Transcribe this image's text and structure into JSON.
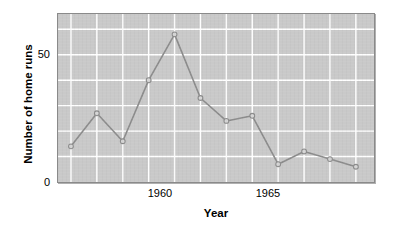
{
  "chart_data": {
    "type": "line",
    "title": "",
    "xlabel": "Year",
    "ylabel": "Number of home runs",
    "x": [
      1957,
      1958,
      1959,
      1960,
      1961,
      1962,
      1963,
      1964,
      1965,
      1966,
      1967,
      1968
    ],
    "values": [
      14,
      27,
      16,
      40,
      58,
      33,
      24,
      26,
      7,
      12,
      9,
      6
    ],
    "series": [
      {
        "name": "Number of home runs",
        "values": [
          14,
          27,
          16,
          40,
          58,
          33,
          24,
          26,
          7,
          12,
          9,
          6
        ]
      }
    ],
    "xlim": [
      1956.5,
      1968.7
    ],
    "ylim": [
      0,
      66
    ],
    "xticks": [
      1960,
      1965
    ],
    "xtick_labels": [
      "1960",
      "1965"
    ],
    "yticks": [
      0,
      50
    ],
    "ytick_labels": [
      "0",
      "50"
    ],
    "grid": true,
    "grid_color": "#ffffff",
    "plot_background": "#c9c9c9",
    "line_color": "#8c8c8c",
    "marker": "circle-open",
    "marker_face_color": "#d6d6d6",
    "legend": null,
    "legend_position": "none"
  },
  "axis": {
    "y_title": "Number of home runs",
    "x_title": "Year",
    "y_ticks": [
      "50",
      "0"
    ],
    "x_ticks": [
      "1960",
      "1965"
    ]
  }
}
